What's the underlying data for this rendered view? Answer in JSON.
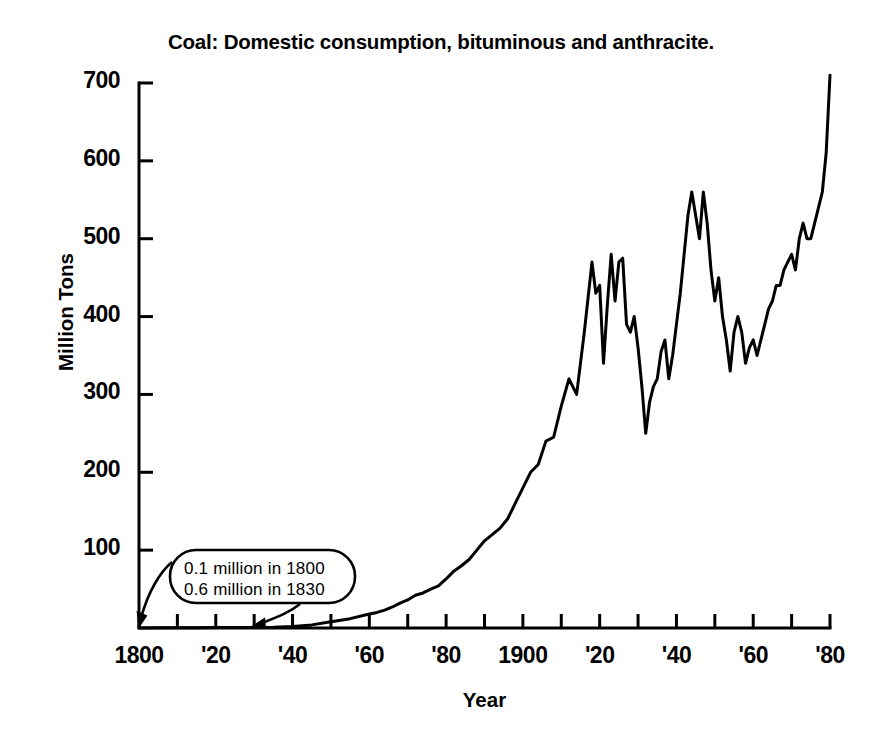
{
  "chart_data": {
    "type": "line",
    "title": "Coal: Domestic consumption, bituminous and anthracite.",
    "xlabel": "Year",
    "ylabel": "Million Tons",
    "xlim": [
      1800,
      1980
    ],
    "ylim": [
      0,
      720
    ],
    "grid": false,
    "legend": "none",
    "y_ticks": [
      100,
      200,
      300,
      400,
      500,
      600,
      700
    ],
    "y_tick_labels": [
      "100",
      "200",
      "300",
      "400",
      "500",
      "600",
      "700"
    ],
    "x_ticks": [
      1800,
      1810,
      1820,
      1830,
      1840,
      1850,
      1860,
      1870,
      1880,
      1890,
      1900,
      1910,
      1920,
      1930,
      1940,
      1950,
      1960,
      1970,
      1980
    ],
    "x_tick_labels_shown": [
      {
        "year": 1800,
        "label": "1800"
      },
      {
        "year": 1820,
        "label": "'20"
      },
      {
        "year": 1840,
        "label": "'40"
      },
      {
        "year": 1860,
        "label": "'60"
      },
      {
        "year": 1880,
        "label": "'80"
      },
      {
        "year": 1900,
        "label": "1900"
      },
      {
        "year": 1920,
        "label": "'20"
      },
      {
        "year": 1940,
        "label": "'40"
      },
      {
        "year": 1960,
        "label": "'60"
      },
      {
        "year": 1980,
        "label": "'80"
      }
    ],
    "annotations": [
      {
        "name": "early-values-callout",
        "lines": [
          "0.1 million in 1800",
          "0.6 million in 1830"
        ],
        "points_to": [
          1800,
          1830
        ]
      }
    ],
    "series": [
      {
        "name": "Domestic coal consumption (bituminous and anthracite)",
        "units": "million tons",
        "x": [
          1800,
          1805,
          1810,
          1815,
          1820,
          1825,
          1830,
          1835,
          1840,
          1845,
          1850,
          1855,
          1860,
          1862,
          1864,
          1866,
          1868,
          1870,
          1872,
          1874,
          1876,
          1878,
          1880,
          1882,
          1884,
          1886,
          1888,
          1890,
          1892,
          1894,
          1896,
          1898,
          1900,
          1902,
          1904,
          1906,
          1908,
          1910,
          1912,
          1914,
          1916,
          1918,
          1919,
          1920,
          1921,
          1922,
          1923,
          1924,
          1925,
          1926,
          1927,
          1928,
          1929,
          1930,
          1931,
          1932,
          1933,
          1934,
          1935,
          1936,
          1937,
          1938,
          1939,
          1940,
          1941,
          1942,
          1943,
          1944,
          1945,
          1946,
          1947,
          1948,
          1949,
          1950,
          1951,
          1952,
          1953,
          1954,
          1955,
          1956,
          1957,
          1958,
          1959,
          1960,
          1961,
          1962,
          1963,
          1964,
          1965,
          1966,
          1967,
          1968,
          1969,
          1970,
          1971,
          1972,
          1973,
          1974,
          1975,
          1976,
          1977,
          1978,
          1979,
          1980
        ],
        "y": [
          0.1,
          0.2,
          0.3,
          0.4,
          0.5,
          0.5,
          0.6,
          1,
          2,
          4,
          8,
          12,
          18,
          20,
          23,
          27,
          32,
          36,
          42,
          45,
          50,
          54,
          63,
          73,
          80,
          88,
          100,
          112,
          120,
          128,
          140,
          160,
          180,
          200,
          210,
          240,
          245,
          285,
          320,
          300,
          380,
          470,
          430,
          440,
          340,
          415,
          480,
          420,
          470,
          475,
          390,
          380,
          400,
          360,
          310,
          250,
          290,
          310,
          320,
          355,
          370,
          320,
          350,
          390,
          430,
          480,
          530,
          560,
          530,
          500,
          560,
          520,
          460,
          420,
          450,
          400,
          370,
          330,
          380,
          400,
          380,
          340,
          360,
          370,
          350,
          370,
          390,
          410,
          420,
          440,
          440,
          460,
          470,
          480,
          460,
          500,
          520,
          500,
          500,
          520,
          540,
          560,
          610,
          710
        ]
      }
    ]
  },
  "axis": {
    "y_label": "Million Tons",
    "x_label": "Year"
  }
}
